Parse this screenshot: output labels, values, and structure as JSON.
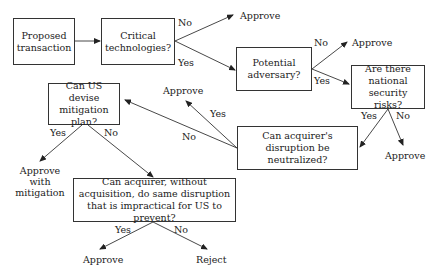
{
  "diagram": {
    "nodes": {
      "proposed": "Proposed transaction",
      "critical": "Critical technologies?",
      "adversary": "Potential adversary?",
      "security": "Are there national security risks?",
      "neutralized": "Can acquirer's disruption be neutralized?",
      "mitigation": "Can US devise mitigation plan?",
      "acquisition": "Can acquirer, without acquisition, do same disruption that is impractical for US to prevent?"
    },
    "outcomes": {
      "approve_1": "Approve",
      "approve_2": "Approve",
      "approve_3": "Approve",
      "approve_4": "Approve",
      "approve_mitigation": "Approve with mitigation",
      "approve_5": "Approve",
      "reject": "Reject"
    },
    "edge_labels": {
      "critical_no": "No",
      "critical_yes": "Yes",
      "adversary_no": "No",
      "adversary_yes": "Yes",
      "security_yes": "Yes",
      "security_no": "No",
      "neutralized_yes": "Yes",
      "neutralized_no": "No",
      "mitigation_yes": "Yes",
      "mitigation_no": "No",
      "acquisition_yes": "Yes",
      "acquisition_no": "No"
    }
  }
}
